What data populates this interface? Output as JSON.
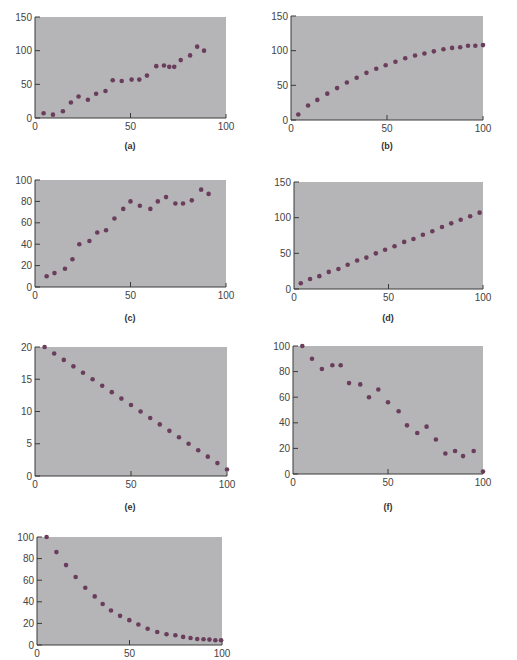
{
  "style": {
    "plot_background": "#b5b5b7",
    "marker_color": "#6a3d5c",
    "axis_color": "#3a3a3a",
    "tick_label_color": "#444444"
  },
  "chart_data": [
    {
      "id": "a",
      "type": "scatter",
      "caption": "(a)",
      "xlim": [
        0,
        100
      ],
      "ylim": [
        0,
        150
      ],
      "xticks": [
        0,
        50,
        100
      ],
      "yticks": [
        0,
        50,
        100,
        150
      ],
      "grid": false,
      "layout": {
        "left": 35,
        "top": 17,
        "right": 226,
        "bottom": 118,
        "caption_x": 130,
        "caption_y": 141
      },
      "x": [
        4.5,
        9.4,
        14.6,
        18.8,
        22.8,
        27.7,
        32,
        36.9,
        40.7,
        45.4,
        50.6,
        54.6,
        58.6,
        63.5,
        67.5,
        70.3,
        72.9,
        76.3,
        81.2,
        84.9,
        88.5
      ],
      "y": [
        7,
        5,
        10,
        23,
        32,
        27,
        36,
        40,
        56,
        55,
        57,
        57,
        63,
        77,
        78,
        76,
        76,
        86,
        93,
        106,
        100
      ]
    },
    {
      "id": "b",
      "type": "scatter",
      "caption": "(b)",
      "xlim": [
        0,
        100
      ],
      "ylim": [
        0,
        150
      ],
      "xticks": [
        0,
        50,
        100
      ],
      "yticks": [
        0,
        50,
        100,
        150
      ],
      "grid": false,
      "layout": {
        "left": 291,
        "top": 16,
        "right": 483,
        "bottom": 120,
        "caption_x": 387,
        "caption_y": 141
      },
      "x": [
        3.8,
        8.9,
        13.7,
        18.9,
        24,
        29.1,
        34.2,
        39.3,
        44.4,
        49.3,
        54.4,
        59.5,
        64.6,
        69.5,
        74.4,
        79.4,
        83.9,
        88.1,
        92.2,
        96,
        100
      ],
      "y": [
        8,
        21,
        29,
        38,
        46,
        54,
        61,
        68,
        74,
        79,
        84,
        89,
        93,
        96,
        99,
        102,
        104,
        105,
        107,
        107,
        108
      ]
    },
    {
      "id": "c",
      "type": "scatter",
      "caption": "(c)",
      "xlim": [
        0,
        100
      ],
      "ylim": [
        0,
        100
      ],
      "xticks": [
        0,
        50,
        100
      ],
      "yticks": [
        0,
        20,
        40,
        60,
        80,
        100
      ],
      "grid": false,
      "layout": {
        "left": 35,
        "top": 180,
        "right": 226,
        "bottom": 287,
        "caption_x": 130,
        "caption_y": 313
      },
      "x": [
        6.1,
        10.2,
        15.7,
        19.6,
        23.2,
        28.5,
        32.6,
        37.2,
        41.6,
        46.2,
        50,
        54.9,
        60.4,
        64.3,
        68.6,
        73.5,
        77.5,
        82.1,
        87,
        90.9
      ],
      "y": [
        10,
        13,
        17,
        26,
        40,
        43,
        51,
        53,
        64,
        73,
        80,
        76,
        73,
        80,
        84,
        78,
        78,
        81,
        91,
        87
      ]
    },
    {
      "id": "d",
      "type": "scatter",
      "caption": "(d)",
      "xlim": [
        0,
        100
      ],
      "ylim": [
        0,
        150
      ],
      "xticks": [
        0,
        50,
        100
      ],
      "yticks": [
        0,
        50,
        100,
        150
      ],
      "grid": false,
      "layout": {
        "left": 294,
        "top": 182,
        "right": 483,
        "bottom": 289,
        "caption_x": 388,
        "caption_y": 313
      },
      "x": [
        3.6,
        8.5,
        13.4,
        18.4,
        23.5,
        28.4,
        33.4,
        38.3,
        43.3,
        48.2,
        53.2,
        58.3,
        63.2,
        68.2,
        73.2,
        78.3,
        83.2,
        88.2,
        93.2,
        98.2
      ],
      "y": [
        8,
        14,
        18,
        24,
        28,
        34,
        40,
        44,
        50,
        55,
        60,
        66,
        70,
        76,
        81,
        87,
        92,
        97,
        102,
        107
      ]
    },
    {
      "id": "e",
      "type": "scatter",
      "caption": "(e)",
      "xlim": [
        0,
        100
      ],
      "ylim": [
        0,
        20
      ],
      "xticks": [
        0,
        50,
        100
      ],
      "yticks": [
        0,
        5,
        10,
        15,
        20
      ],
      "grid": false,
      "layout": {
        "left": 35,
        "top": 347,
        "right": 227,
        "bottom": 476,
        "caption_x": 130,
        "caption_y": 502
      },
      "x": [
        5,
        10,
        15,
        20,
        25,
        30,
        35,
        40,
        45,
        50,
        55,
        60,
        65,
        70,
        75,
        80,
        85,
        90,
        95,
        100
      ],
      "y": [
        20,
        19,
        18,
        17,
        16,
        15,
        14,
        13,
        12,
        11,
        10,
        9,
        8,
        7,
        6,
        5,
        4,
        3,
        2,
        1
      ]
    },
    {
      "id": "f",
      "type": "scatter",
      "caption": "(f)",
      "xlim": [
        0,
        100
      ],
      "ylim": [
        0,
        100
      ],
      "xticks": [
        0,
        50,
        100
      ],
      "yticks": [
        0,
        20,
        40,
        60,
        80,
        100
      ],
      "grid": false,
      "layout": {
        "left": 293,
        "top": 346,
        "right": 483,
        "bottom": 474,
        "caption_x": 388,
        "caption_y": 502
      },
      "x": [
        4.9,
        10,
        15.2,
        20.7,
        25.1,
        29.5,
        35.4,
        40,
        44.9,
        50,
        55.6,
        60,
        65.4,
        70.3,
        75.2,
        80.2,
        85.3,
        89.5,
        95.1,
        100
      ],
      "y": [
        100,
        90,
        82,
        85,
        85,
        71,
        70,
        60,
        66,
        56,
        49,
        38,
        32,
        37,
        27,
        16,
        18,
        14,
        18,
        2
      ]
    },
    {
      "id": "g",
      "type": "scatter",
      "caption": "",
      "xlim": [
        0,
        100
      ],
      "ylim": [
        0,
        100
      ],
      "xticks": [
        0,
        50,
        100
      ],
      "yticks": [
        0,
        20,
        40,
        60,
        80,
        100
      ],
      "grid": false,
      "layout": {
        "left": 37,
        "top": 537,
        "right": 222,
        "bottom": 645,
        "caption_x": 130,
        "caption_y": 670
      },
      "x": [
        5.2,
        10.5,
        15.7,
        20.9,
        26.1,
        31.2,
        35.5,
        40,
        44.9,
        49.9,
        54.8,
        59.8,
        65,
        70,
        74.8,
        79,
        83,
        86.6,
        90,
        93.2,
        96.4,
        99.5
      ],
      "y": [
        100,
        86,
        74,
        63,
        53,
        45,
        38,
        32,
        27,
        23,
        19,
        15,
        12,
        10,
        9,
        7.5,
        6.5,
        5.6,
        5.3,
        5,
        4.4,
        4.4
      ]
    }
  ]
}
